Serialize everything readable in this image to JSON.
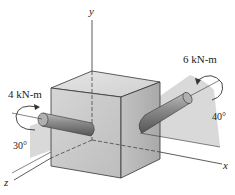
{
  "figure": {
    "axes": {
      "x": "x",
      "y": "y",
      "z": "z"
    },
    "moments": [
      {
        "label": "4 kN-m",
        "angle": "30°",
        "side": "left"
      },
      {
        "label": "6 kN-m",
        "angle": "40°",
        "side": "right"
      }
    ],
    "colors": {
      "cube_front": "#c9c9c9",
      "cube_top": "#dedede",
      "cube_side": "#b5b5b5",
      "plane": "#d8d8d8",
      "rod": "#8a8a8a",
      "line": "#333333"
    }
  }
}
